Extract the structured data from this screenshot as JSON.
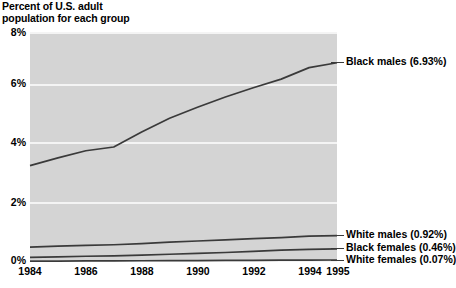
{
  "chart_data": {
    "type": "line",
    "title": "Percent of U.S. adult\npopulation for each group",
    "xlabel": "",
    "ylabel": "",
    "x": [
      1984,
      1985,
      1986,
      1987,
      1988,
      1989,
      1990,
      1991,
      1992,
      1993,
      1994,
      1995
    ],
    "xtick_labels": [
      "1984",
      "1986",
      "1988",
      "1990",
      "1992",
      "1994",
      "1995"
    ],
    "xtick_values": [
      1984,
      1986,
      1988,
      1990,
      1992,
      1994,
      1995
    ],
    "ytick_labels": [
      "0%",
      "2%",
      "4%",
      "6%",
      "8%"
    ],
    "ytick_values": [
      0,
      2,
      4,
      6,
      8
    ],
    "xlim": [
      1984,
      1995
    ],
    "ylim": [
      0,
      8
    ],
    "grid": "horizontal",
    "legend_position": "right-inline-annotations",
    "series": [
      {
        "name": "Black males",
        "final_value": "6.93%",
        "label": "Black males (6.93%)",
        "values": [
          3.35,
          3.62,
          3.87,
          4.0,
          4.52,
          5.0,
          5.38,
          5.74,
          6.06,
          6.36,
          6.76,
          6.93
        ]
      },
      {
        "name": "White males",
        "final_value": "0.92%",
        "label": "White males (0.92%)",
        "values": [
          0.52,
          0.55,
          0.58,
          0.6,
          0.64,
          0.69,
          0.73,
          0.77,
          0.81,
          0.85,
          0.9,
          0.92
        ]
      },
      {
        "name": "Black females",
        "final_value": "0.46%",
        "label": "Black females (0.46%)",
        "values": [
          0.16,
          0.18,
          0.2,
          0.21,
          0.24,
          0.27,
          0.3,
          0.33,
          0.37,
          0.41,
          0.44,
          0.46
        ]
      },
      {
        "name": "White females",
        "final_value": "0.07%",
        "label": "White females (0.07%)",
        "values": [
          0.03,
          0.033,
          0.036,
          0.04,
          0.043,
          0.047,
          0.05,
          0.055,
          0.06,
          0.064,
          0.068,
          0.07
        ]
      }
    ],
    "colors": {
      "plot_background": "#d4d4d4",
      "gridline": "#f4f4f4",
      "line": "#3a3a3a",
      "text": "#000000",
      "page_background": "#ffffff"
    }
  }
}
